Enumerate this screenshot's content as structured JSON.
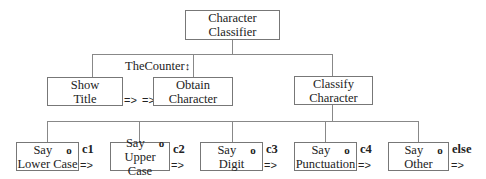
{
  "root": {
    "line1": "Character",
    "line2": "Classifier"
  },
  "level1": {
    "show_title": {
      "line1": "Show",
      "line2": "Title"
    },
    "obtain_character": {
      "line1": "Obtain",
      "line2": "Character"
    },
    "classify_character": {
      "line1": "Classify",
      "line2": "Character"
    },
    "counter_label": "TheCounter",
    "counter_icon": "↕",
    "flow_arrow_1": "=>",
    "flow_arrow_2": "=>"
  },
  "level2": {
    "options": [
      {
        "say": "Say",
        "name": "Lower Case",
        "marker": "o",
        "condition": "c1",
        "arrow": "=>"
      },
      {
        "say": "Say",
        "name": "Upper Case",
        "marker": "o",
        "condition": "c2",
        "arrow": "=>"
      },
      {
        "say": "Say",
        "name": "Digit",
        "marker": "o",
        "condition": "c3",
        "arrow": "=>"
      },
      {
        "say": "Say",
        "name": "Punctuation",
        "marker": "o",
        "condition": "c4",
        "arrow": "=>"
      },
      {
        "say": "Say",
        "name": "Other",
        "marker": "o",
        "condition": "else",
        "arrow": "=>"
      }
    ]
  }
}
